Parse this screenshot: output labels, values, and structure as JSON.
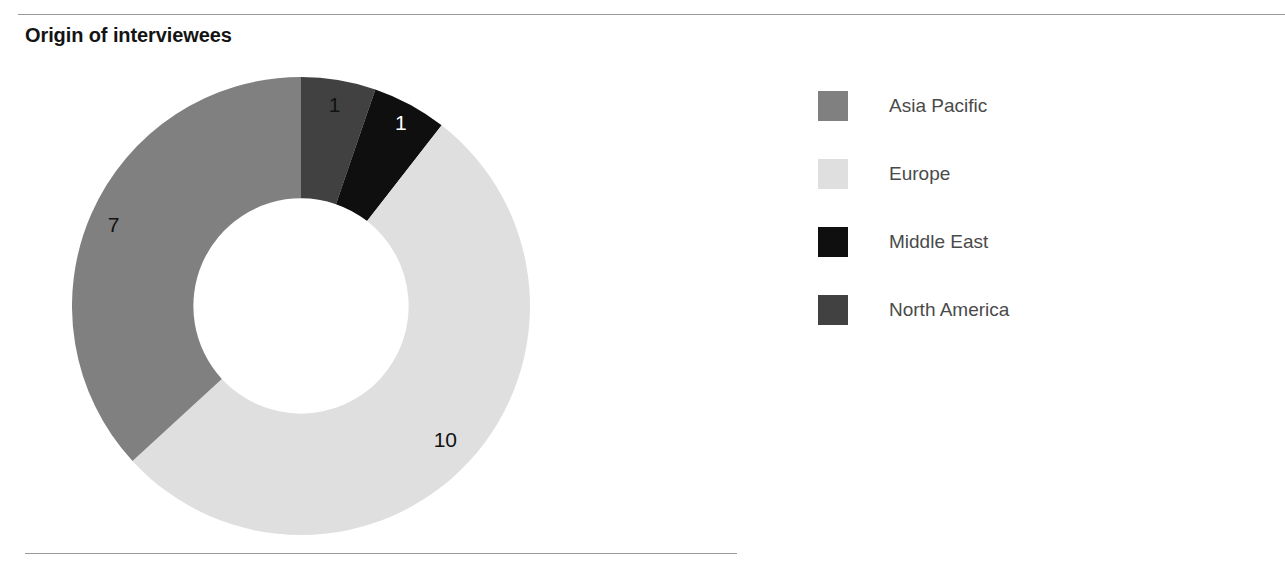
{
  "chart_data": {
    "type": "pie",
    "variant": "donut",
    "title": "Origin of interviewees",
    "categories": [
      "North America",
      "Middle East",
      "Europe",
      "Asia Pacific"
    ],
    "values": [
      1,
      1,
      10,
      7
    ],
    "total": 19,
    "xlabel": "",
    "ylabel": "",
    "grid": false,
    "legend_position": "right",
    "start_angle_deg": 0,
    "direction": "clockwise",
    "inner_radius_ratio": 0.47,
    "slices": [
      {
        "name": "North America",
        "value": 1,
        "label": "1",
        "color": "#414141",
        "label_color": "#111111",
        "start_deg": 0.0,
        "end_deg": 18.95
      },
      {
        "name": "Middle East",
        "value": 1,
        "label": "1",
        "color": "#0f0f0f",
        "label_color": "#ffffff",
        "start_deg": 18.95,
        "end_deg": 37.89
      },
      {
        "name": "Europe",
        "value": 10,
        "label": "10",
        "color": "#dfdfdf",
        "label_color": "#111111",
        "start_deg": 37.89,
        "end_deg": 227.37
      },
      {
        "name": "Asia Pacific",
        "value": 7,
        "label": "7",
        "color": "#808080",
        "label_color": "#111111",
        "start_deg": 227.37,
        "end_deg": 360.0
      }
    ]
  },
  "legend": {
    "items": [
      {
        "label": "Asia Pacific",
        "color": "#808080"
      },
      {
        "label": "Europe",
        "color": "#dfdfdf"
      },
      {
        "label": "Middle East",
        "color": "#0f0f0f"
      },
      {
        "label": "North America",
        "color": "#414141"
      }
    ]
  },
  "labels": {
    "north_america": "1",
    "middle_east": "1",
    "europe": "10",
    "asia_pacific": "7"
  }
}
